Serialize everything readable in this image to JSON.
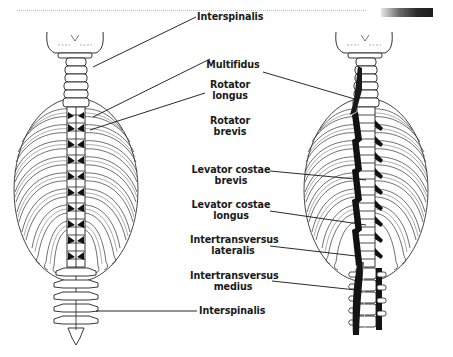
{
  "figure": {
    "decor": {
      "top_rule": "dotted",
      "accent_bar": "gradient",
      "accent_colors": [
        "#e8e8e8",
        "#1c1c1c"
      ]
    },
    "panels": [
      {
        "id": "left",
        "view": "posterior spine with ribcage",
        "muscles_shown": [
          "Interspinalis",
          "Rotator longus",
          "Rotator brevis"
        ]
      },
      {
        "id": "right",
        "view": "posterior spine with ribcage",
        "muscles_shown": [
          "Multifidus",
          "Levator costae brevis",
          "Levator costae longus",
          "Intertransversus lateralis",
          "Intertransversus medius"
        ]
      }
    ],
    "labels": {
      "interspinalis_top": "Interspinalis",
      "multifidus": "Multifidus",
      "rotator_longus_1": "Rotator",
      "rotator_longus_2": "longus",
      "rotator_brevis_1": "Rotator",
      "rotator_brevis_2": "brevis",
      "lev_costae_brevis_1": "Levator costae",
      "lev_costae_brevis_2": "brevis",
      "lev_costae_longus_1": "Levator costae",
      "lev_costae_longus_2": "longus",
      "intertrans_lat_1": "Intertransversus",
      "intertrans_lat_2": "lateralis",
      "intertrans_med_1": "Intertransversus",
      "intertrans_med_2": "medius",
      "interspinalis_bottom": "Interspinalis"
    }
  }
}
